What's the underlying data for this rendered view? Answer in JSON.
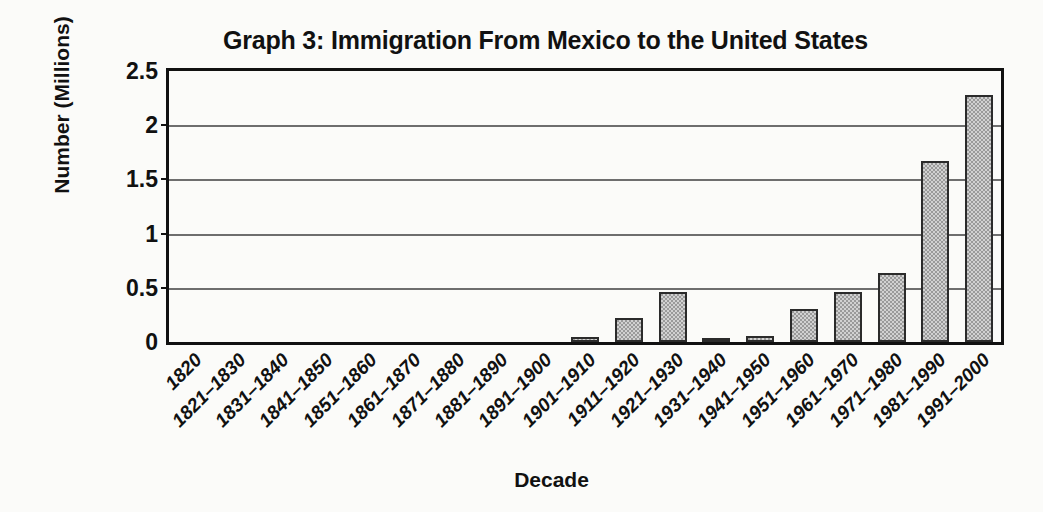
{
  "chart_data": {
    "type": "bar",
    "title": "Graph 3: Immigration From Mexico to the United States",
    "xlabel": "Decade",
    "ylabel": "Number (Millions)",
    "ylim": [
      0,
      2.5
    ],
    "yticks": [
      0,
      0.5,
      1,
      1.5,
      2,
      2.5
    ],
    "ytick_labels": [
      "0",
      "0.5",
      "1",
      "1.5",
      "2",
      "2.5"
    ],
    "grid": true,
    "legend": "none",
    "bar_color": "#9a9a9a",
    "bar_border_color": "#2b2b2b",
    "categories": [
      "1820",
      "1821–1830",
      "1831–1840",
      "1841–1850",
      "1851–1860",
      "1861–1870",
      "1871–1880",
      "1881–1890",
      "1891–1900",
      "1901–1910",
      "1911–1920",
      "1921–1930",
      "1931–1940",
      "1941–1950",
      "1951–1960",
      "1961–1970",
      "1971–1980",
      "1981–1990",
      "1991–2000"
    ],
    "values": [
      0,
      0,
      0,
      0,
      0,
      0,
      0,
      0,
      0,
      0.05,
      0.22,
      0.46,
      0.02,
      0.06,
      0.3,
      0.46,
      0.64,
      1.67,
      2.28
    ]
  }
}
